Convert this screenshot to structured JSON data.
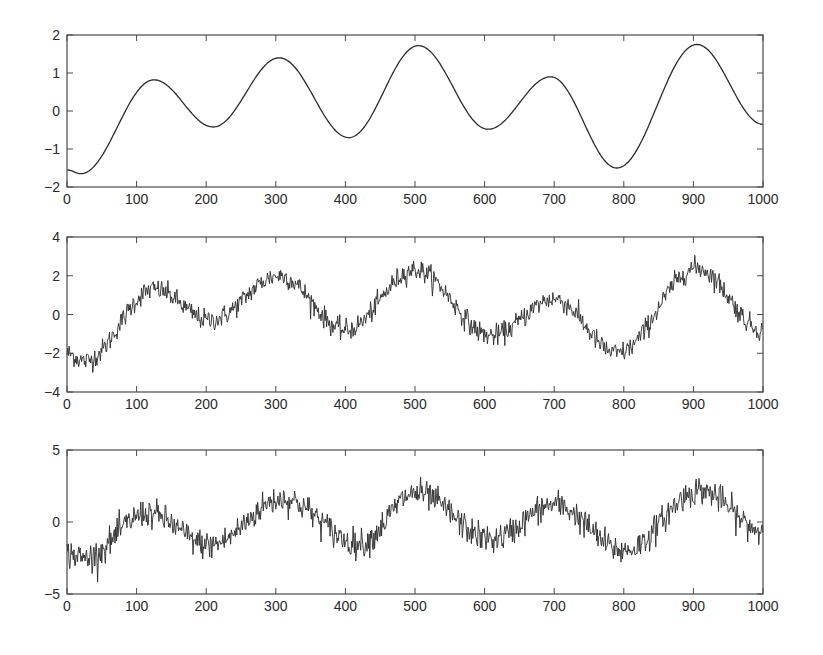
{
  "chart_data": [
    {
      "type": "line",
      "title": "",
      "xlabel": "",
      "ylabel": "",
      "xlim": [
        0,
        1000
      ],
      "ylim": [
        -2,
        2
      ],
      "xticks": [
        0,
        100,
        200,
        300,
        400,
        500,
        600,
        700,
        800,
        900,
        1000
      ],
      "yticks": [
        -2,
        -1,
        0,
        1,
        2
      ],
      "grid": false,
      "legend": null,
      "series": [
        {
          "name": "smooth signal",
          "x": [
            0,
            20,
            125,
            210,
            305,
            405,
            505,
            605,
            695,
            790,
            905,
            1000
          ],
          "y": [
            -1.55,
            -1.65,
            0.82,
            -0.42,
            1.4,
            -0.7,
            1.72,
            -0.48,
            0.9,
            -1.5,
            1.75,
            -0.35
          ]
        }
      ],
      "frame": {
        "left": 67,
        "right": 763,
        "top": 35,
        "bottom": 187
      }
    },
    {
      "type": "line",
      "title": "",
      "xlabel": "",
      "ylabel": "",
      "xlim": [
        0,
        1000
      ],
      "ylim": [
        -4,
        4
      ],
      "xticks": [
        0,
        100,
        200,
        300,
        400,
        500,
        600,
        700,
        800,
        900,
        1000
      ],
      "yticks": [
        -4,
        -2,
        0,
        2,
        4
      ],
      "grid": false,
      "legend": null,
      "series": [
        {
          "name": "signal + moderate noise",
          "x": [
            0,
            25,
            125,
            205,
            305,
            400,
            500,
            610,
            700,
            790,
            905,
            1000
          ],
          "y": [
            -2.0,
            -2.4,
            1.3,
            -0.3,
            2.0,
            -0.8,
            2.3,
            -1.1,
            0.8,
            -2.0,
            2.4,
            -0.8
          ]
        }
      ],
      "noise_amplitude": 0.5,
      "frame": {
        "left": 67,
        "right": 763,
        "top": 237,
        "bottom": 392
      }
    },
    {
      "type": "line",
      "title": "",
      "xlabel": "",
      "ylabel": "",
      "xlim": [
        0,
        1000
      ],
      "ylim": [
        -5,
        5
      ],
      "xticks": [
        0,
        100,
        200,
        300,
        400,
        500,
        600,
        700,
        800,
        900,
        1000
      ],
      "yticks": [
        -5,
        0,
        5
      ],
      "grid": false,
      "legend": null,
      "series": [
        {
          "name": "signal + strong noise",
          "x": [
            0,
            25,
            115,
            205,
            310,
            420,
            500,
            610,
            700,
            800,
            910,
            1000
          ],
          "y": [
            -2.2,
            -2.5,
            0.6,
            -1.6,
            1.6,
            -1.5,
            2.0,
            -1.2,
            1.2,
            -2.0,
            2.2,
            -0.6
          ]
        }
      ],
      "noise_amplitude": 0.9,
      "frame": {
        "left": 67,
        "right": 763,
        "top": 450,
        "bottom": 594
      }
    }
  ],
  "style": {
    "line_color": "#2b2b2b",
    "axis_color": "#4a4a4a",
    "background": "#ffffff"
  }
}
